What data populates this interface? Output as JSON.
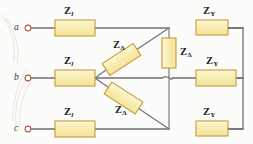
{
  "diagram": {
    "background_color": "#fcfcfa",
    "wire_color": "#6f6f72",
    "terminal_ring_color": "#b4564a",
    "box_fill": "#f7edb0",
    "box_fill_light": "#fbf6d2",
    "box_stroke": "#c79a36",
    "text_color": "#1a1a1a"
  },
  "terminals": [
    {
      "id": "terminal-a",
      "label": "a"
    },
    {
      "id": "terminal-b",
      "label": "b"
    },
    {
      "id": "terminal-c",
      "label": "c"
    }
  ],
  "line_impedances": [
    {
      "id": "z-line-a",
      "symbol": "Z",
      "subscript": "l"
    },
    {
      "id": "z-line-b",
      "symbol": "Z",
      "subscript": "l"
    },
    {
      "id": "z-line-c",
      "symbol": "Z",
      "subscript": "l"
    }
  ],
  "delta_impedances": [
    {
      "id": "z-delta-upper",
      "symbol": "Z",
      "subscript": "Δ"
    },
    {
      "id": "z-delta-right",
      "symbol": "Z",
      "subscript": "Δ"
    },
    {
      "id": "z-delta-lower",
      "symbol": "Z",
      "subscript": "Δ"
    }
  ],
  "wye_impedances": [
    {
      "id": "z-wye-a",
      "symbol": "Z",
      "subscript": "Y"
    },
    {
      "id": "z-wye-b",
      "symbol": "Z",
      "subscript": "Y"
    },
    {
      "id": "z-wye-c",
      "symbol": "Z",
      "subscript": "Y"
    }
  ]
}
